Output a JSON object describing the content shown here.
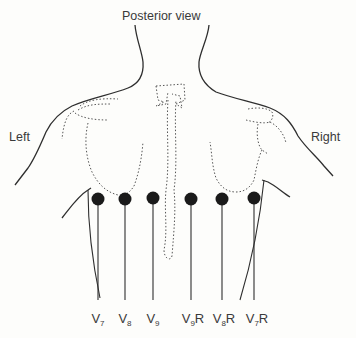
{
  "diagram": {
    "title": "Posterior view",
    "side_labels": {
      "left": "Left",
      "right": "Right"
    },
    "electrodes": [
      {
        "lead": "V",
        "sub": "7",
        "suffix": "",
        "x": 98
      },
      {
        "lead": "V",
        "sub": "8",
        "suffix": "",
        "x": 125
      },
      {
        "lead": "V",
        "sub": "9",
        "suffix": "",
        "x": 153
      },
      {
        "lead": "V",
        "sub": "9",
        "suffix": "R",
        "x": 191
      },
      {
        "lead": "V",
        "sub": "8",
        "suffix": "R",
        "x": 222
      },
      {
        "lead": "V",
        "sub": "7",
        "suffix": "R",
        "x": 254
      }
    ],
    "colors": {
      "outline": "#2e2e2e",
      "dotted": "#555555",
      "electrode": "#1a1a1a",
      "background": "#fdfdfb"
    }
  }
}
